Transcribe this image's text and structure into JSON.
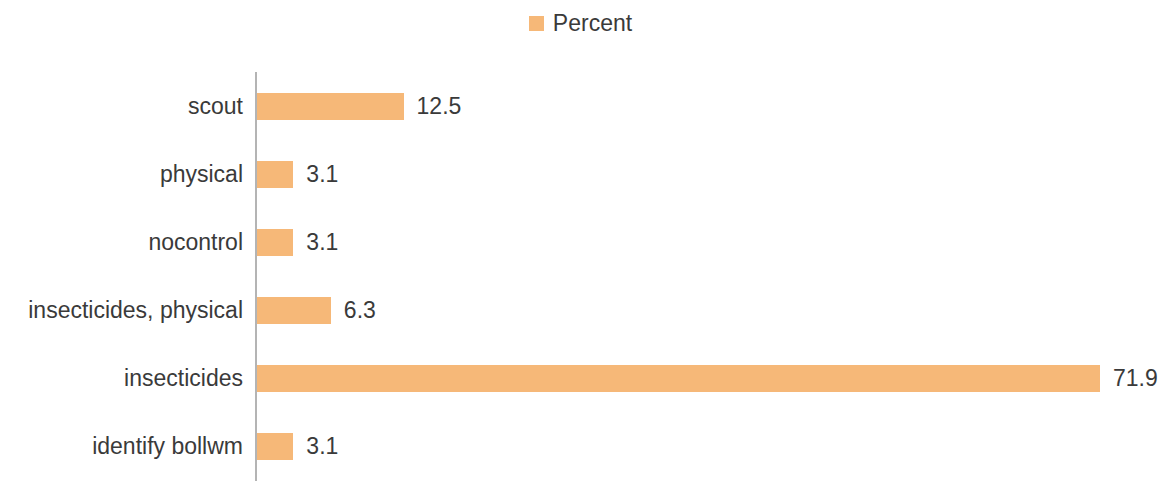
{
  "legend": {
    "position": "top-center",
    "entries": [
      {
        "label": "Percent",
        "color": "#f6b878",
        "marker": "square-marker-icon"
      }
    ]
  },
  "axis": {
    "line_color": "#b4b4b4",
    "orientation": "vertical"
  },
  "chart_data": {
    "type": "bar",
    "orientation": "horizontal",
    "title": "",
    "subtitle": "",
    "xlabel": "",
    "ylabel": "",
    "legend_position": "top-center",
    "grid": false,
    "series_color": "#f6b878",
    "data_labels": true,
    "xlim": [
      0,
      71.9
    ],
    "categories": [
      "scout",
      "physical",
      "nocontrol",
      "insecticides, physical",
      "insecticides",
      "identify bollwm"
    ],
    "series": [
      {
        "name": "Percent",
        "values": [
          12.5,
          3.1,
          3.1,
          6.3,
          71.9,
          3.1
        ]
      }
    ],
    "value_labels": [
      "12.5",
      "3.1",
      "3.1",
      "6.3",
      "71.9",
      "3.1"
    ]
  }
}
